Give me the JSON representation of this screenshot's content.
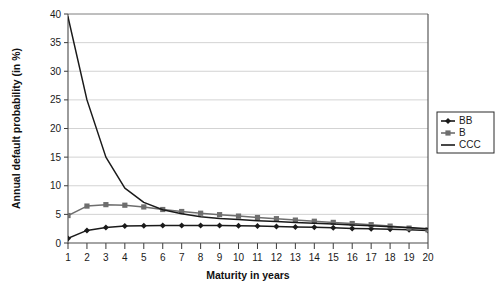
{
  "chart_data": {
    "type": "line",
    "title": "",
    "xlabel": "Maturity in years",
    "ylabel": "Annual default probability (in %)",
    "xlim": [
      1,
      20
    ],
    "ylim": [
      0,
      40
    ],
    "ytick_step": 5,
    "grid": "horizontal",
    "legend_position": "right",
    "x": [
      1,
      2,
      3,
      4,
      5,
      6,
      7,
      8,
      9,
      10,
      11,
      12,
      13,
      14,
      15,
      16,
      17,
      18,
      19,
      20
    ],
    "xticklabels": [
      "1",
      "2",
      "3",
      "4",
      "5",
      "6",
      "7",
      "8",
      "9",
      "10",
      "11",
      "12",
      "13",
      "14",
      "15",
      "16",
      "17",
      "18",
      "19",
      "20"
    ],
    "yticklabels": [
      "0",
      "5",
      "10",
      "15",
      "20",
      "25",
      "30",
      "35",
      "40"
    ],
    "yticks": [
      0,
      5,
      10,
      15,
      20,
      25,
      30,
      35,
      40
    ],
    "series": [
      {
        "name": "BB",
        "color": "#1a1a1a",
        "marker": "diamond",
        "values": [
          0.8,
          2.2,
          2.7,
          2.95,
          3.0,
          3.05,
          3.05,
          3.05,
          3.05,
          3.0,
          2.95,
          2.9,
          2.8,
          2.75,
          2.65,
          2.55,
          2.5,
          2.4,
          2.3,
          2.2
        ]
      },
      {
        "name": "B",
        "color": "#6e6e6e",
        "marker": "square",
        "values": [
          4.8,
          6.45,
          6.7,
          6.6,
          6.3,
          5.85,
          5.5,
          5.2,
          4.95,
          4.7,
          4.45,
          4.25,
          4.0,
          3.8,
          3.6,
          3.4,
          3.2,
          2.95,
          2.6,
          2.3
        ]
      },
      {
        "name": "CCC",
        "color": "#1a1a1a",
        "marker": "none",
        "values": [
          39.5,
          25.0,
          15.0,
          9.6,
          7.1,
          5.8,
          5.1,
          4.6,
          4.3,
          4.1,
          3.9,
          3.75,
          3.6,
          3.45,
          3.3,
          3.15,
          3.0,
          2.85,
          2.7,
          2.5
        ]
      }
    ]
  },
  "legend": {
    "entries": [
      {
        "label": "BB"
      },
      {
        "label": "B"
      },
      {
        "label": "CCC"
      }
    ]
  }
}
